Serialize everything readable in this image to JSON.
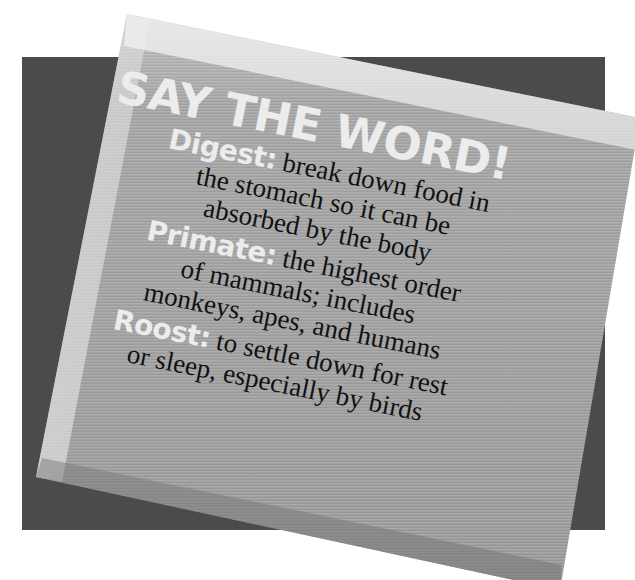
{
  "colors": {
    "background": "#ffffff",
    "backing": "#4b4b4b",
    "card": "#a6a6a6",
    "heading_text": "#ececec",
    "body_text": "#111111"
  },
  "card": {
    "title": "SAY THE WORD!",
    "entries": [
      {
        "term": "Digest:",
        "lines": [
          " break down food in",
          "the stomach so it can be",
          "absorbed by the body"
        ]
      },
      {
        "term": "Primate:",
        "lines": [
          " the highest order",
          "of mammals; includes",
          "monkeys, apes, and humans"
        ]
      },
      {
        "term": "Roost:",
        "lines": [
          " to settle down for rest",
          "or sleep, especially by birds"
        ]
      }
    ]
  }
}
